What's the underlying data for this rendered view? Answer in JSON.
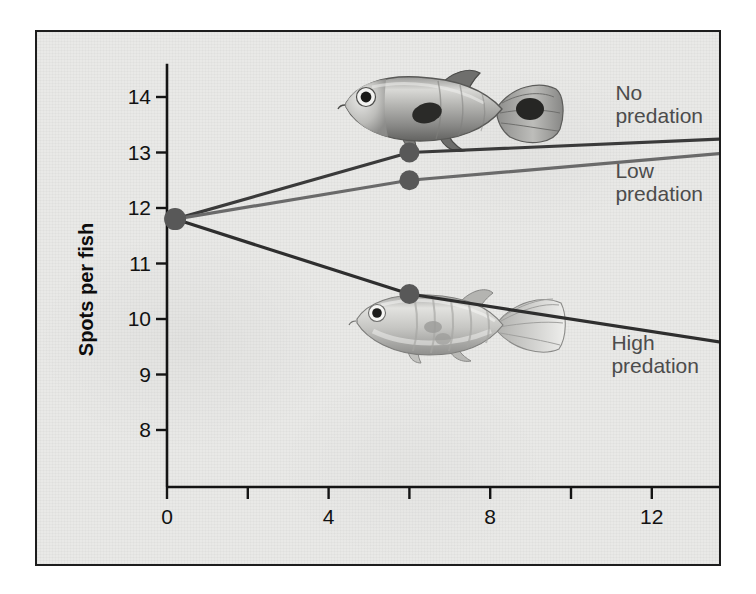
{
  "chart_data": {
    "type": "line",
    "title": "",
    "xlabel": "Months",
    "ylabel": "Spots per fish",
    "xlim": [
      0,
      14.4
    ],
    "ylim": [
      7.45,
      14.6
    ],
    "xticks": [
      0,
      4,
      8,
      12
    ],
    "xticks_minor": [
      2,
      6,
      10,
      14
    ],
    "yticks": [
      8,
      9,
      10,
      11,
      12,
      13,
      14
    ],
    "grid": false,
    "legend_position": "inline-right",
    "x": [
      0.2,
      6,
      14
    ],
    "series": [
      {
        "name": "No predation",
        "color": "#3a3a3a",
        "marker_color_start": "#585858",
        "marker_color_end": "#7d7d7d",
        "values": [
          11.8,
          13.0,
          13.25
        ]
      },
      {
        "name": "Low predation",
        "color": "#6a6a6a",
        "marker_color_start": "#585858",
        "marker_color_end": "#2f2f2f",
        "values": [
          11.8,
          12.5,
          13.0
        ]
      },
      {
        "name": "High predation",
        "color": "#2e2e2e",
        "marker_color_start": "#585858",
        "marker_color_end": "#3a3a3a",
        "values": [
          11.8,
          10.45,
          9.55
        ]
      }
    ],
    "annotations": [
      {
        "text": "No\npredation",
        "x": 11.1,
        "y": 14.05
      },
      {
        "text": "Low\npredation",
        "x": 11.1,
        "y": 12.65
      },
      {
        "text": "High\npredation",
        "x": 11.0,
        "y": 9.55
      }
    ],
    "illustrations": [
      {
        "name": "spotted-male-guppy",
        "caption": "",
        "x": 7.0,
        "y": 13.75
      },
      {
        "name": "drab-guppy",
        "caption": "",
        "x": 7.2,
        "y": 9.9
      }
    ]
  },
  "axes": {
    "y_tick_labels": [
      "14",
      "13",
      "12",
      "11",
      "10",
      "9",
      "8"
    ],
    "x_tick_labels": [
      "0",
      "4",
      "8",
      "12"
    ],
    "y_title": "Spots per fish",
    "x_title": "Months"
  },
  "labels": {
    "no_predation": "No\npredation",
    "low_predation": "Low\npredation",
    "high_predation": "High\npredation"
  },
  "colors": {
    "panel_background": "#e9e9e7",
    "frame_border": "#1d1d1d",
    "axis": "#141414",
    "label_text": "#4c4c4c",
    "tick_text": "#121212"
  }
}
